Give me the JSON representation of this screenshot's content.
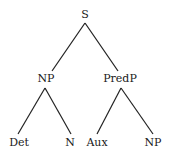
{
  "tree": {
    "nodes": [
      {
        "id": "S",
        "label": "S",
        "x": 85,
        "y": 9
      },
      {
        "id": "NP1",
        "label": "NP",
        "x": 46,
        "y": 73
      },
      {
        "id": "PredP",
        "label": "PredP",
        "x": 120,
        "y": 73
      },
      {
        "id": "Det",
        "label": "Det",
        "x": 19,
        "y": 137
      },
      {
        "id": "N",
        "label": "N",
        "x": 70,
        "y": 137
      },
      {
        "id": "Aux",
        "label": "Aux",
        "x": 97,
        "y": 137
      },
      {
        "id": "NP2",
        "label": "NP",
        "x": 153,
        "y": 137
      }
    ],
    "edges": [
      [
        "S",
        "NP1"
      ],
      [
        "S",
        "PredP"
      ],
      [
        "NP1",
        "Det"
      ],
      [
        "NP1",
        "N"
      ],
      [
        "PredP",
        "Aux"
      ],
      [
        "PredP",
        "NP2"
      ]
    ]
  }
}
